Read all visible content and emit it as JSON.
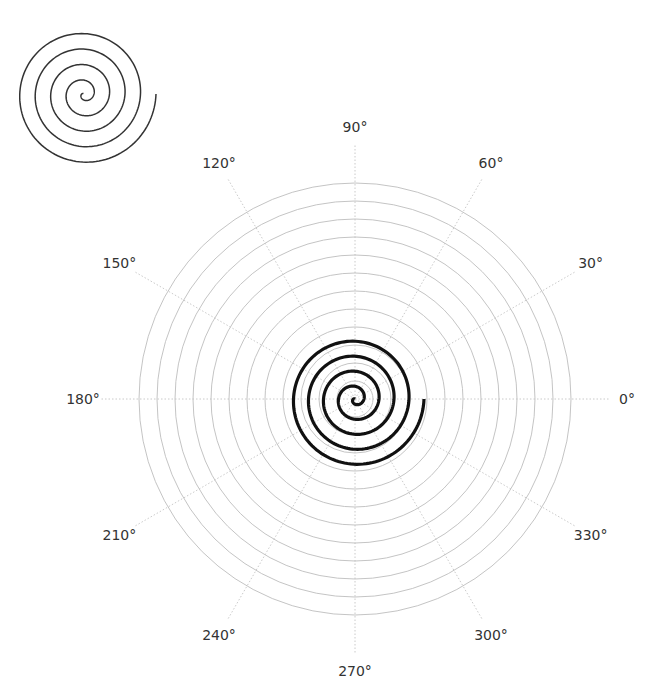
{
  "chart_data": {
    "type": "line",
    "subtype": "polar",
    "title": "",
    "center": [
      355,
      399
    ],
    "grid": {
      "on": true,
      "circles": 12,
      "circle_spacing_px": 18,
      "outer_radius_px": 216,
      "radial_line_step_deg": 30,
      "radial_line_length_px": 255
    },
    "angular_ticks": [
      {
        "deg": 0,
        "label": "0°"
      },
      {
        "deg": 30,
        "label": "30°"
      },
      {
        "deg": 60,
        "label": "60°"
      },
      {
        "deg": 90,
        "label": "90°"
      },
      {
        "deg": 120,
        "label": "120°"
      },
      {
        "deg": 150,
        "label": "150°"
      },
      {
        "deg": 180,
        "label": "180°"
      },
      {
        "deg": 210,
        "label": "210°"
      },
      {
        "deg": 240,
        "label": "240°"
      },
      {
        "deg": 270,
        "label": "270°"
      },
      {
        "deg": 300,
        "label": "300°"
      },
      {
        "deg": 330,
        "label": "330°"
      }
    ],
    "label_radius_px": 272,
    "series": [
      {
        "name": "spiral",
        "equation": "r = b * t",
        "pitch_px_per_turn": 15,
        "end_radius_px": 69,
        "end_angle_deg": 0,
        "turns": 4.6,
        "color": "#111111",
        "line_width": 3.2
      }
    ],
    "thumbnail": {
      "center": [
        84,
        94
      ],
      "pitch_px_per_turn": 15.5,
      "end_radius_px": 72,
      "end_angle_deg": 0,
      "turns": 4.6,
      "color": "#333333",
      "line_width": 1.5
    }
  }
}
